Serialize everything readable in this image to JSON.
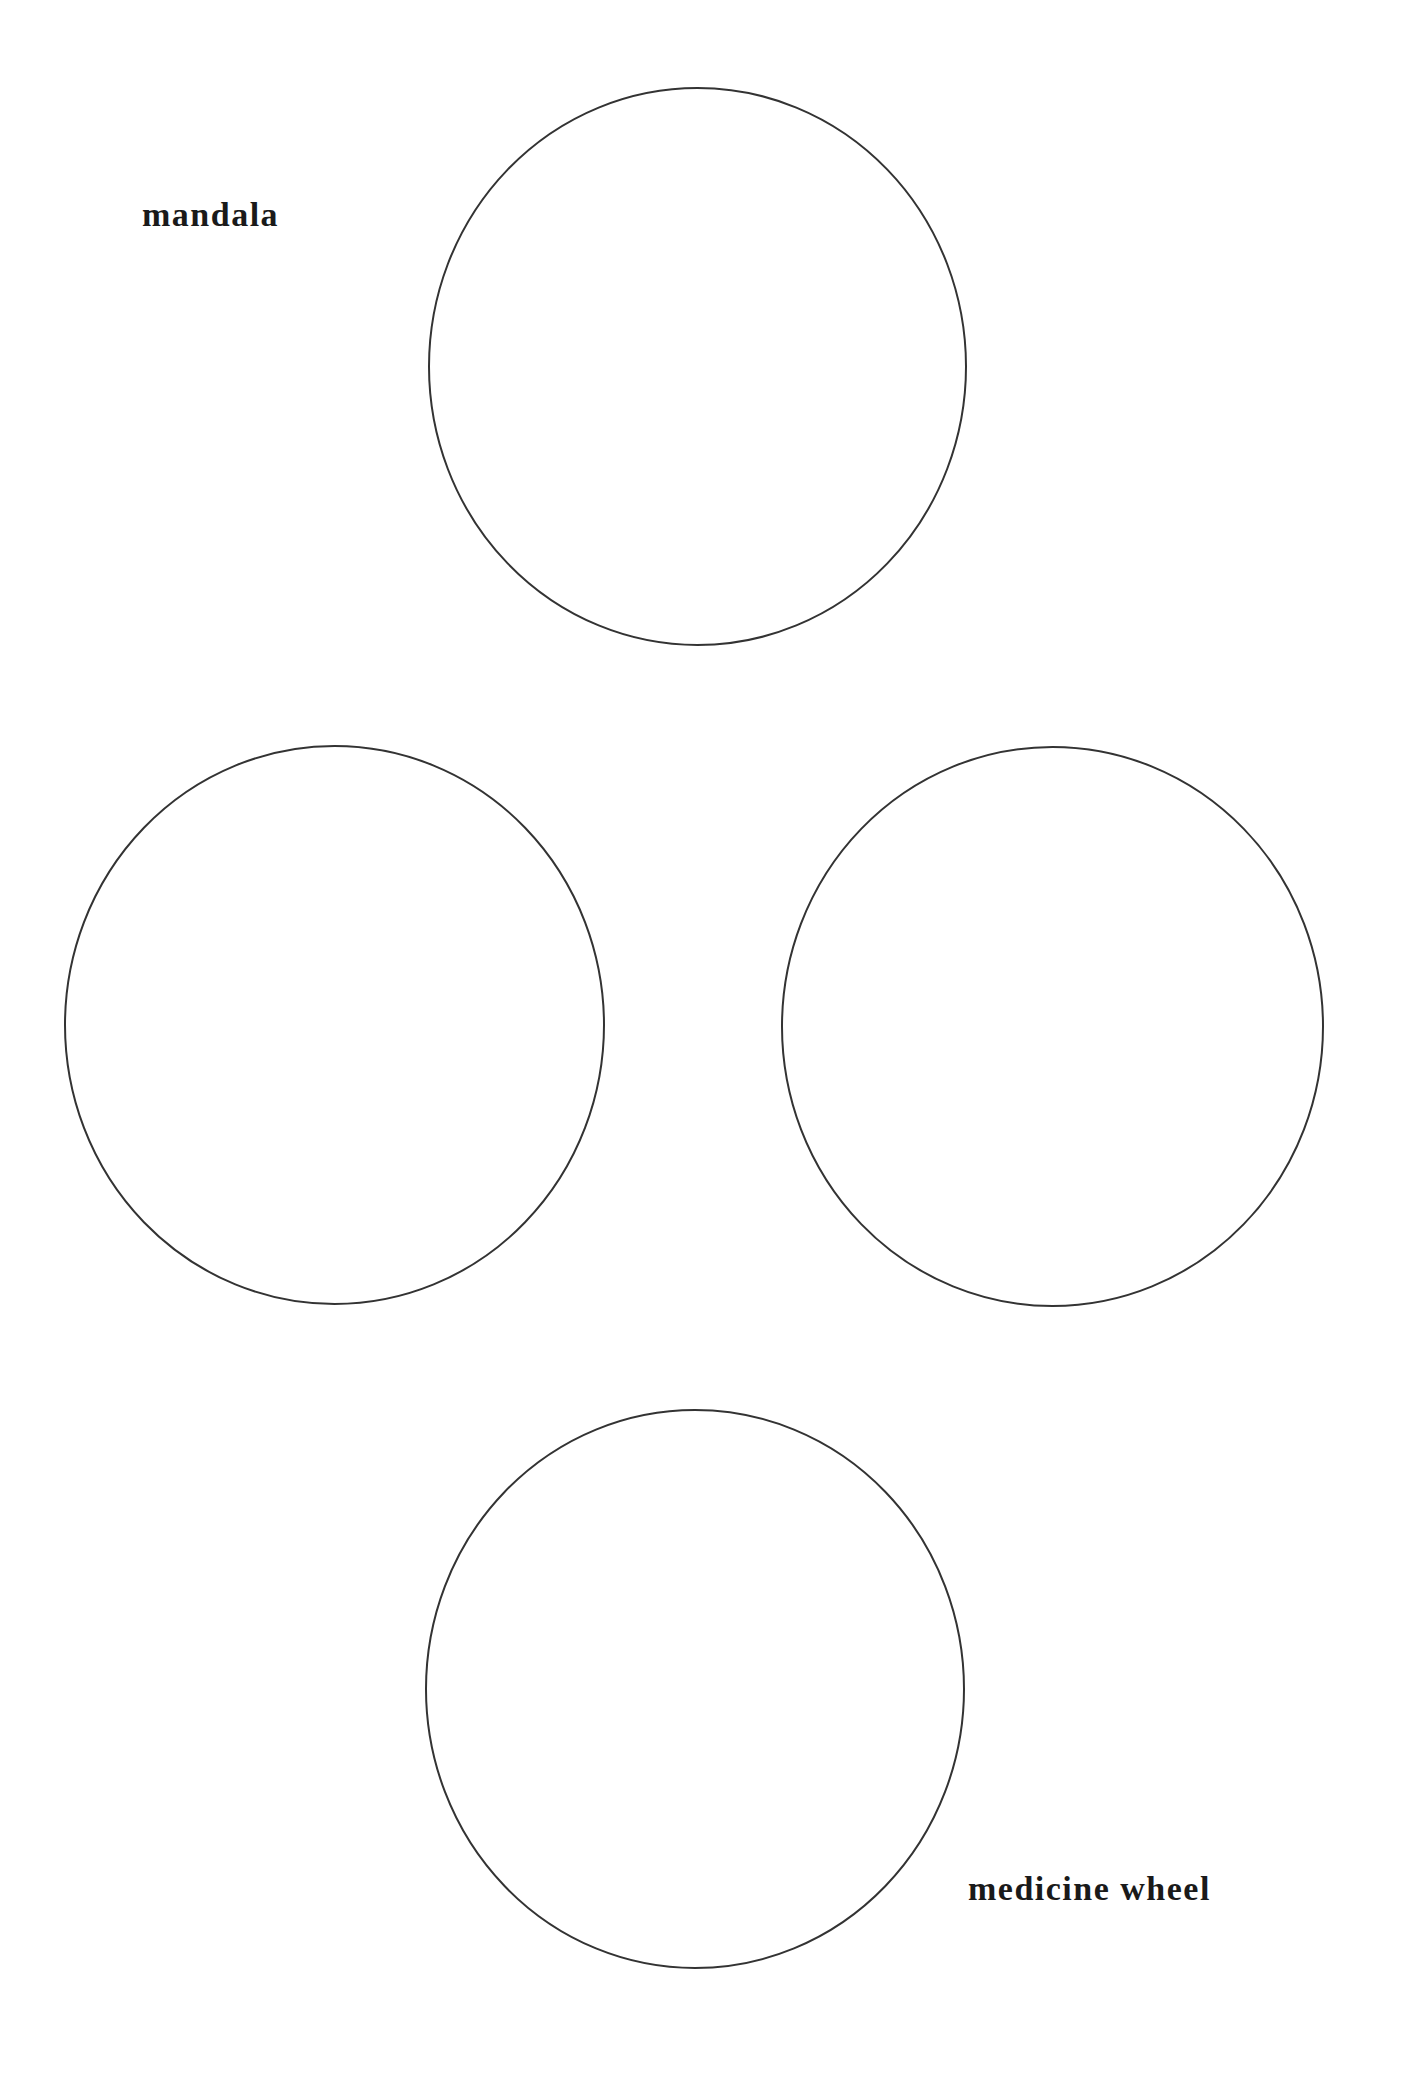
{
  "labels": {
    "top_left": "mandala",
    "bottom_right": "medicine wheel"
  },
  "circles": [
    {
      "name": "top",
      "cx": 697.5,
      "cy": 366.5,
      "rx": 268.5,
      "ry": 278.5
    },
    {
      "name": "left",
      "cx": 334.5,
      "cy": 1025,
      "rx": 269.5,
      "ry": 279
    },
    {
      "name": "right",
      "cx": 1052.5,
      "cy": 1026.5,
      "rx": 270.5,
      "ry": 279.5
    },
    {
      "name": "bottom",
      "cx": 695,
      "cy": 1689,
      "rx": 269,
      "ry": 279
    }
  ],
  "colors": {
    "background": "#ffffff",
    "stroke": "#333333",
    "text": "#1a1a1a"
  }
}
